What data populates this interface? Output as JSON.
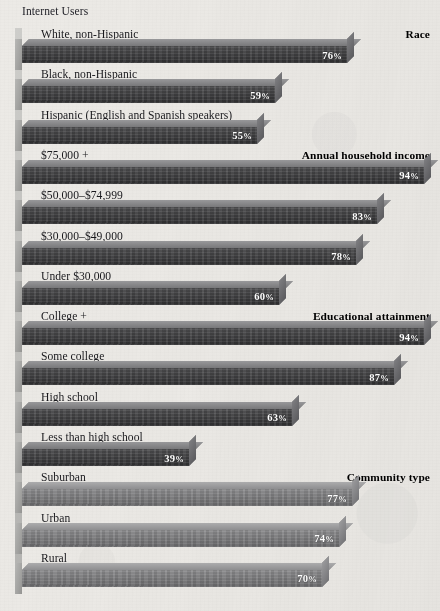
{
  "caption": "Internet Users",
  "colors": {
    "background": "#eceae6",
    "bar_dark": "#3c3c3e",
    "bar_light": "#7c7c7e",
    "bar_top": "#8b8b8c",
    "text": "#16161a"
  },
  "chart_data": {
    "type": "bar",
    "orientation": "horizontal",
    "title": "Internet Users",
    "xlabel": "",
    "ylabel": "",
    "xlim": [
      0,
      100
    ],
    "grid": false,
    "legend": false,
    "value_suffix": "%",
    "groups": [
      {
        "name": "Race",
        "categories": [
          "White, non-Hispanic",
          "Black, non-Hispanic",
          "Hispanic (English and Spanish speakers)"
        ],
        "values": [
          76,
          59,
          55
        ]
      },
      {
        "name": "Annual household income",
        "categories": [
          "$75,000 +",
          "$50,000–$74,999",
          "$30,000–$49,000",
          "Under $30,000"
        ],
        "values": [
          94,
          83,
          78,
          60
        ]
      },
      {
        "name": "Educational attainment",
        "categories": [
          "College +",
          "Some college",
          "High school",
          "Less than high school"
        ],
        "values": [
          94,
          87,
          63,
          39
        ]
      },
      {
        "name": "Community type",
        "categories": [
          "Suburban",
          "Urban",
          "Rural"
        ],
        "values": [
          77,
          74,
          70
        ]
      }
    ],
    "categories": [
      "White, non-Hispanic",
      "Black, non-Hispanic",
      "Hispanic (English and Spanish speakers)",
      "$75,000 +",
      "$50,000–$74,999",
      "$30,000–$49,000",
      "Under $30,000",
      "College +",
      "Some college",
      "High school",
      "Less than high school",
      "Suburban",
      "Urban",
      "Rural"
    ],
    "values": [
      76,
      59,
      55,
      94,
      83,
      78,
      60,
      94,
      87,
      63,
      39,
      77,
      74,
      70
    ]
  },
  "rows": [
    {
      "label": "White, non-Hispanic",
      "value": "76",
      "suffix": "%",
      "pct": 76,
      "group": "Race",
      "style": "dark"
    },
    {
      "label": "Black, non-Hispanic",
      "value": "59",
      "suffix": "%",
      "pct": 59,
      "group": "",
      "style": "dark"
    },
    {
      "label": "Hispanic (English and Spanish speakers)",
      "value": "55",
      "suffix": "%",
      "pct": 55,
      "group": "",
      "style": "dark"
    },
    {
      "label": "$75,000 +",
      "value": "94",
      "suffix": "%",
      "pct": 94,
      "group": "Annual household income",
      "style": "dark"
    },
    {
      "label": "$50,000–$74,999",
      "value": "83",
      "suffix": "%",
      "pct": 83,
      "group": "",
      "style": "dark"
    },
    {
      "label": "$30,000–$49,000",
      "value": "78",
      "suffix": "%",
      "pct": 78,
      "group": "",
      "style": "dark"
    },
    {
      "label": "Under $30,000",
      "value": "60",
      "suffix": "%",
      "pct": 60,
      "group": "",
      "style": "dark"
    },
    {
      "label": "College +",
      "value": "94",
      "suffix": "%",
      "pct": 94,
      "group": "Educational attainment",
      "style": "dark"
    },
    {
      "label": "Some college",
      "value": "87",
      "suffix": "%",
      "pct": 87,
      "group": "",
      "style": "dark"
    },
    {
      "label": "High school",
      "value": "63",
      "suffix": "%",
      "pct": 63,
      "group": "",
      "style": "dark"
    },
    {
      "label": "Less than high school",
      "value": "39",
      "suffix": "%",
      "pct": 39,
      "group": "",
      "style": "dark"
    },
    {
      "label": "Suburban",
      "value": "77",
      "suffix": "%",
      "pct": 77,
      "group": "Community type",
      "style": "light"
    },
    {
      "label": "Urban",
      "value": "74",
      "suffix": "%",
      "pct": 74,
      "group": "",
      "style": "light"
    },
    {
      "label": "Rural",
      "value": "70",
      "suffix": "%",
      "pct": 70,
      "group": "",
      "style": "light"
    }
  ]
}
